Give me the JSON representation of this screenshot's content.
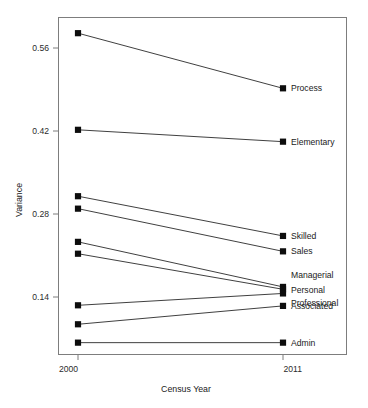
{
  "chart_data": {
    "type": "line",
    "title": "",
    "subtitle": "",
    "xlabel": "Census Year",
    "ylabel": "Variance",
    "x": [
      2000,
      2011
    ],
    "xtick_labels": [
      "2000",
      "2011"
    ],
    "ytick_labels": [
      "0.14",
      "0.28",
      "0.42",
      "0.56"
    ],
    "yticks": [
      0.14,
      0.28,
      0.42,
      0.56
    ],
    "ylim": [
      0.04,
      0.6
    ],
    "xlim": [
      2000,
      2011
    ],
    "grid": false,
    "legend": "right-inline-labels",
    "marker": "filled-square",
    "series": [
      {
        "name": "Process",
        "values": [
          0.585,
          0.492
        ]
      },
      {
        "name": "Elementary",
        "values": [
          0.422,
          0.402
        ]
      },
      {
        "name": "Skilled",
        "values": [
          0.31,
          0.243
        ]
      },
      {
        "name": "Sales",
        "values": [
          0.289,
          0.217
        ]
      },
      {
        "name": "Managerial",
        "values": [
          0.233,
          0.157
        ]
      },
      {
        "name": "Personal",
        "values": [
          0.213,
          0.153
        ]
      },
      {
        "name": "Professional",
        "values": [
          0.126,
          0.146
        ]
      },
      {
        "name": "Associated",
        "values": [
          0.094,
          0.125
        ]
      },
      {
        "name": "Admin",
        "values": [
          0.063,
          0.063
        ]
      }
    ],
    "annotations": []
  },
  "colors": {
    "line": "#2a2a2a",
    "marker": "#0d0d0d",
    "frame": "#7d7d7d",
    "text": "#1a1a1a",
    "background": "#ffffff"
  }
}
